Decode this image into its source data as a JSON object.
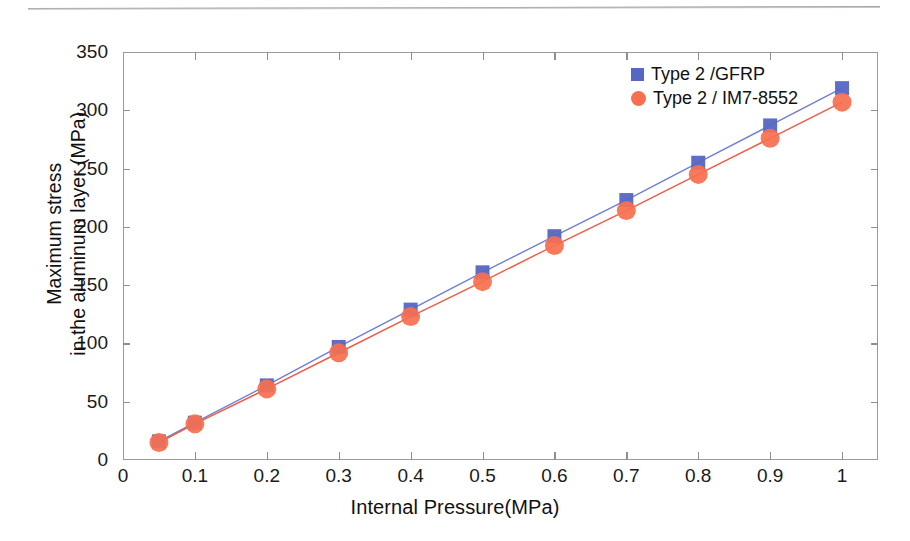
{
  "chart_data": {
    "type": "line",
    "title": "",
    "xlabel": "Internal Pressure(MPa)",
    "ylabel_line1": "Maximum stress",
    "ylabel_line2": "in the aluminum layer (MPa)",
    "xlim": [
      0,
      1.05
    ],
    "ylim": [
      0,
      350
    ],
    "xticks": [
      "0",
      "0.1",
      "0.2",
      "0.3",
      "0.4",
      "0.5",
      "0.6",
      "0.7",
      "0.8",
      "0.9",
      "1"
    ],
    "xtick_values": [
      0,
      0.1,
      0.2,
      0.3,
      0.4,
      0.5,
      0.6,
      0.7,
      0.8,
      0.9,
      1.0
    ],
    "yticks": [
      "0",
      "50",
      "100",
      "150",
      "200",
      "250",
      "300",
      "350"
    ],
    "ytick_values": [
      0,
      50,
      100,
      150,
      200,
      250,
      300,
      350
    ],
    "grid": false,
    "legend_position": "upper right",
    "x": [
      0.05,
      0.1,
      0.2,
      0.3,
      0.4,
      0.5,
      0.6,
      0.7,
      0.8,
      0.9,
      1.0
    ],
    "series": [
      {
        "name": "Type 2 /GFRP",
        "marker": "square",
        "color": "#5566c4",
        "line_color": "#6f7fd0",
        "values": [
          16,
          32,
          64,
          97,
          129,
          161,
          192,
          223,
          255,
          287,
          319
        ]
      },
      {
        "name": "Type 2 / IM7-8552",
        "marker": "circle",
        "color": "#f76f4f",
        "line_color": "#ef5a45",
        "values": [
          15,
          31,
          61,
          92,
          123,
          153,
          184,
          214,
          245,
          276,
          307
        ]
      }
    ]
  },
  "legend": {
    "items": [
      {
        "label": "Type 2 /GFRP",
        "marker": "square",
        "color": "#5566c4"
      },
      {
        "label": "Type 2 / IM7-8552",
        "marker": "circle",
        "color": "#f76f4f"
      }
    ]
  },
  "artifacts": {
    "scan_line": "horizontal-scan-artifact"
  }
}
